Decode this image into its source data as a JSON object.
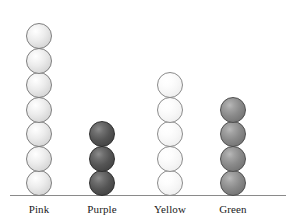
{
  "chart_data": {
    "type": "bar",
    "subtype": "pictograph-stacked-spheres",
    "title": "",
    "subtitle": "",
    "xlabel": "",
    "ylabel": "",
    "categories": [
      "Pink",
      "Purple",
      "Yellow",
      "Green"
    ],
    "values": [
      7,
      3,
      5,
      4
    ],
    "unit_symbol": "sphere",
    "unit_value": 1,
    "ylim": [
      0,
      7
    ],
    "grid": false,
    "legend": null,
    "axis": {
      "baseline_visible": true,
      "y_axis_visible": false,
      "tick_labels": []
    },
    "series": [
      {
        "name": "Count",
        "values": [
          7,
          3,
          5,
          4
        ]
      }
    ],
    "points": [
      {
        "category": "Pink",
        "value": 7,
        "tone": "pink",
        "color": "#ececec"
      },
      {
        "category": "Purple",
        "value": 3,
        "tone": "purple",
        "color": "#555555"
      },
      {
        "category": "Yellow",
        "value": 5,
        "tone": "yellow",
        "color": "#f7f7f7"
      },
      {
        "category": "Green",
        "value": 4,
        "tone": "green",
        "color": "#8a8a8a"
      }
    ]
  },
  "colors": {
    "background": "#ffffff",
    "baseline": "#8a8a8a",
    "label_text": "#1a1a1a"
  },
  "layout": {
    "column_x": [
      12,
      75,
      143,
      206
    ],
    "baseline_y": 195
  }
}
